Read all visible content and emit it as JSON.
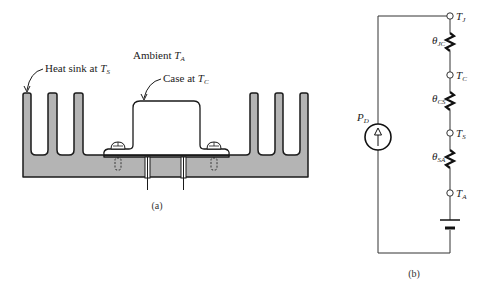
{
  "figure_a": {
    "caption": "(a)",
    "labels": {
      "heat_sink": {
        "text": "Heat sink at ",
        "var": "T",
        "sub": "S"
      },
      "ambient": {
        "text": "Ambient ",
        "var": "T",
        "sub": "A"
      },
      "case": {
        "text": "Case at ",
        "var": "T",
        "sub": "C"
      }
    },
    "colors": {
      "heatsink_fill": "#b4b4b4",
      "stroke": "#1a1a1a",
      "background": "#ffffff"
    }
  },
  "figure_b": {
    "caption": "(b)",
    "source": {
      "var": "P",
      "sub": "D"
    },
    "nodes": [
      {
        "var": "T",
        "sub": "J"
      },
      {
        "var": "T",
        "sub": "C"
      },
      {
        "var": "T",
        "sub": "S"
      },
      {
        "var": "T",
        "sub": "A"
      }
    ],
    "resistors": [
      {
        "var": "θ",
        "sub": "JC"
      },
      {
        "var": "θ",
        "sub": "CS"
      },
      {
        "var": "θ",
        "sub": "SA"
      }
    ]
  }
}
